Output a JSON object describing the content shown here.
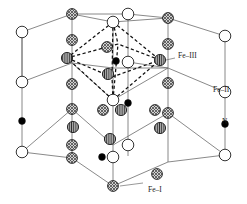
{
  "figure": {
    "background": "#ffffff",
    "line_color": "#6b6b6b",
    "dashed_color": "#111111",
    "outline_color": "#111111"
  },
  "labels": [
    {
      "id": "fe3",
      "text": "Fe–III",
      "x": 178,
      "y": 58
    },
    {
      "id": "fe2",
      "text": "Fe–II",
      "x": 213,
      "y": 92
    },
    {
      "id": "n",
      "text": "N",
      "x": 222,
      "y": 124
    },
    {
      "id": "fe1",
      "text": "Fe–I",
      "x": 148,
      "y": 192
    }
  ],
  "legend": {
    "fe1": {
      "name": "Fe–I",
      "style": "cross-hatched",
      "fill": "#b9b9b9",
      "r": 5.4
    },
    "fe2": {
      "name": "Fe–II",
      "style": "open",
      "fill": "#ffffff",
      "r": 5.8
    },
    "fe3": {
      "name": "Fe–III",
      "style": "striped",
      "fill": "#8f8f8f",
      "r": 5.6
    },
    "n": {
      "name": "N",
      "style": "solid",
      "fill": "#000000",
      "r": 3.4
    }
  },
  "cell_edges": [
    {
      "x1": 22,
      "y1": 32,
      "x2": 22,
      "y2": 121
    },
    {
      "x1": 22,
      "y1": 121,
      "x2": 22,
      "y2": 152
    },
    {
      "x1": 22,
      "y1": 32,
      "x2": 22,
      "y2": 82
    },
    {
      "x1": 225,
      "y1": 36,
      "x2": 225,
      "y2": 92
    },
    {
      "x1": 225,
      "y1": 92,
      "x2": 225,
      "y2": 124
    },
    {
      "x1": 225,
      "y1": 124,
      "x2": 225,
      "y2": 155
    },
    {
      "x1": 72,
      "y1": 14,
      "x2": 72,
      "y2": 63
    },
    {
      "x1": 72,
      "y1": 63,
      "x2": 72,
      "y2": 109
    },
    {
      "x1": 72,
      "y1": 109,
      "x2": 72,
      "y2": 158
    },
    {
      "x1": 168,
      "y1": 18,
      "x2": 168,
      "y2": 68
    },
    {
      "x1": 168,
      "y1": 68,
      "x2": 168,
      "y2": 113
    },
    {
      "x1": 168,
      "y1": 113,
      "x2": 168,
      "y2": 162
    },
    {
      "x1": 113,
      "y1": 22,
      "x2": 113,
      "y2": 100
    },
    {
      "x1": 113,
      "y1": 100,
      "x2": 113,
      "y2": 145
    },
    {
      "x1": 113,
      "y1": 145,
      "x2": 113,
      "y2": 186
    },
    {
      "x1": 128,
      "y1": 14,
      "x2": 128,
      "y2": 62
    },
    {
      "x1": 128,
      "y1": 62,
      "x2": 128,
      "y2": 108
    },
    {
      "x1": 128,
      "y1": 108,
      "x2": 128,
      "y2": 156
    },
    {
      "x1": 22,
      "y1": 32,
      "x2": 72,
      "y2": 14
    },
    {
      "x1": 72,
      "y1": 14,
      "x2": 128,
      "y2": 14
    },
    {
      "x1": 128,
      "y1": 14,
      "x2": 168,
      "y2": 18
    },
    {
      "x1": 168,
      "y1": 18,
      "x2": 225,
      "y2": 36
    },
    {
      "x1": 22,
      "y1": 82,
      "x2": 72,
      "y2": 63
    },
    {
      "x1": 72,
      "y1": 63,
      "x2": 113,
      "y2": 68
    },
    {
      "x1": 113,
      "y1": 68,
      "x2": 168,
      "y2": 68
    },
    {
      "x1": 168,
      "y1": 68,
      "x2": 225,
      "y2": 92
    },
    {
      "x1": 22,
      "y1": 152,
      "x2": 72,
      "y2": 158
    },
    {
      "x1": 72,
      "y1": 158,
      "x2": 113,
      "y2": 186
    },
    {
      "x1": 113,
      "y1": 186,
      "x2": 168,
      "y2": 162
    },
    {
      "x1": 168,
      "y1": 162,
      "x2": 225,
      "y2": 155
    },
    {
      "x1": 22,
      "y1": 152,
      "x2": 72,
      "y2": 109
    },
    {
      "x1": 72,
      "y1": 109,
      "x2": 113,
      "y2": 145
    },
    {
      "x1": 113,
      "y1": 145,
      "x2": 168,
      "y2": 113
    },
    {
      "x1": 168,
      "y1": 113,
      "x2": 225,
      "y2": 155
    },
    {
      "x1": 72,
      "y1": 14,
      "x2": 113,
      "y2": 22
    },
    {
      "x1": 113,
      "y1": 22,
      "x2": 168,
      "y2": 18
    },
    {
      "x1": 128,
      "y1": 62,
      "x2": 168,
      "y2": 68
    },
    {
      "x1": 72,
      "y1": 63,
      "x2": 113,
      "y2": 100
    },
    {
      "x1": 113,
      "y1": 100,
      "x2": 168,
      "y2": 68
    }
  ],
  "octahedron": {
    "vertices": {
      "top": {
        "x": 113,
        "y": 22
      },
      "bottom": {
        "x": 113,
        "y": 100
      },
      "left": {
        "x": 67,
        "y": 58
      },
      "right": {
        "x": 160,
        "y": 60
      },
      "front": {
        "x": 112,
        "y": 77
      },
      "back": {
        "x": 118,
        "y": 44
      }
    },
    "edges": [
      [
        "top",
        "left"
      ],
      [
        "top",
        "right"
      ],
      [
        "top",
        "front"
      ],
      [
        "top",
        "back"
      ],
      [
        "bottom",
        "left"
      ],
      [
        "bottom",
        "right"
      ],
      [
        "bottom",
        "front"
      ],
      [
        "bottom",
        "back"
      ],
      [
        "left",
        "front"
      ],
      [
        "front",
        "right"
      ],
      [
        "right",
        "back"
      ],
      [
        "back",
        "left"
      ]
    ]
  },
  "atoms": [
    {
      "type": "fe2",
      "x": 22,
      "y": 32
    },
    {
      "type": "fe2",
      "x": 22,
      "y": 82
    },
    {
      "type": "n",
      "x": 22,
      "y": 121
    },
    {
      "type": "fe2",
      "x": 22,
      "y": 152
    },
    {
      "type": "fe1",
      "x": 72,
      "y": 14
    },
    {
      "type": "fe1",
      "x": 72,
      "y": 40
    },
    {
      "type": "fe1",
      "x": 72,
      "y": 84
    },
    {
      "type": "fe1",
      "x": 72,
      "y": 109
    },
    {
      "type": "fe1",
      "x": 72,
      "y": 158
    },
    {
      "type": "fe3",
      "x": 67,
      "y": 58
    },
    {
      "type": "fe3",
      "x": 73,
      "y": 127
    },
    {
      "type": "fe2",
      "x": 113,
      "y": 22
    },
    {
      "type": "fe2",
      "x": 128,
      "y": 14
    },
    {
      "type": "fe1",
      "x": 107,
      "y": 47
    },
    {
      "type": "n",
      "x": 116,
      "y": 61
    },
    {
      "type": "fe2",
      "x": 128,
      "y": 62
    },
    {
      "type": "fe3",
      "x": 108,
      "y": 74
    },
    {
      "type": "fe2",
      "x": 113,
      "y": 100
    },
    {
      "type": "n",
      "x": 128,
      "y": 103
    },
    {
      "type": "fe1",
      "x": 103,
      "y": 110
    },
    {
      "type": "fe3",
      "x": 121,
      "y": 110
    },
    {
      "type": "fe3",
      "x": 110,
      "y": 139
    },
    {
      "type": "fe2",
      "x": 128,
      "y": 145
    },
    {
      "type": "fe1",
      "x": 72,
      "y": 145
    },
    {
      "type": "n",
      "x": 102,
      "y": 157
    },
    {
      "type": "fe2",
      "x": 113,
      "y": 157
    },
    {
      "type": "fe1",
      "x": 113,
      "y": 186
    },
    {
      "type": "fe1",
      "x": 168,
      "y": 18
    },
    {
      "type": "fe1",
      "x": 168,
      "y": 44
    },
    {
      "type": "fe3",
      "x": 160,
      "y": 60
    },
    {
      "type": "fe1",
      "x": 168,
      "y": 83
    },
    {
      "type": "fe1",
      "x": 155,
      "y": 110
    },
    {
      "type": "fe3",
      "x": 160,
      "y": 128
    },
    {
      "type": "fe1",
      "x": 157,
      "y": 174
    },
    {
      "type": "fe1",
      "x": 168,
      "y": 113
    },
    {
      "type": "fe2",
      "x": 225,
      "y": 36
    },
    {
      "type": "fe2",
      "x": 225,
      "y": 92
    },
    {
      "type": "n",
      "x": 225,
      "y": 124
    },
    {
      "type": "fe2",
      "x": 225,
      "y": 155
    }
  ],
  "label_leaders": [
    {
      "id": "fe3-leader",
      "x1": 166,
      "y1": 60,
      "x2": 175,
      "y2": 58
    },
    {
      "id": "fe1-leader",
      "x1": 143,
      "y1": 183,
      "x2": 120,
      "y2": 186
    }
  ]
}
